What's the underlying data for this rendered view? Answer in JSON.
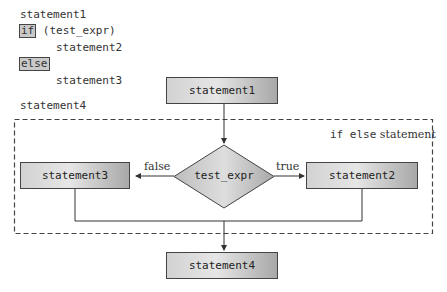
{
  "code": {
    "line1": "statement1",
    "if_keyword": "if",
    "condition": " (test_expr)",
    "line3": "statement2",
    "else_keyword": "else",
    "line5": "statement3",
    "line6": "statement4"
  },
  "flowchart": {
    "statement1": "statement1",
    "decision": "test_expr",
    "false_label": "false",
    "true_label": "true",
    "statement2": "statement2",
    "statement3": "statement3",
    "statement4": "statement4",
    "group_label_code": "if else",
    "group_label_text": " statement"
  },
  "colors": {
    "box_border": "#444444",
    "box_fill_light": "#e6e6e6",
    "box_fill_dark": "#a8a8a8",
    "dashed_border": "#444444"
  }
}
